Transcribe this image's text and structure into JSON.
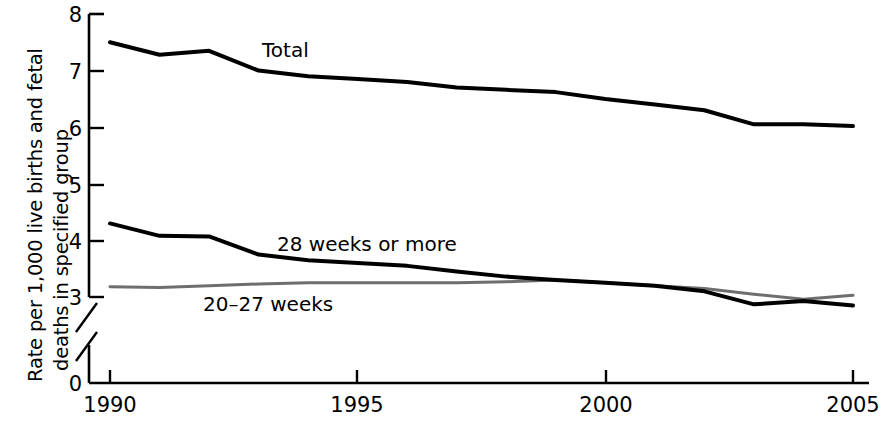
{
  "figure": {
    "background": "#ffffff",
    "axis_color": "#000000"
  },
  "axes": {
    "y_label_line_1": "Rate per 1,000 live births and fetal",
    "y_label_line_2": "deaths in specified group",
    "y_ticks": [
      "8",
      "7",
      "6",
      "5",
      "4",
      "3",
      "0"
    ],
    "y_axis_break": true,
    "x_ticks": [
      "1990",
      "1995",
      "2000",
      "2005"
    ]
  },
  "series_labels": {
    "total": "Total",
    "weeks28": "28 weeks or more",
    "weeks2027": "20–27 weeks"
  },
  "colors": {
    "total": "#000000",
    "weeks28": "#000000",
    "weeks2027": "#6e6e6e"
  },
  "chart_data": {
    "type": "line",
    "title": "",
    "xlabel": "",
    "ylabel": "Rate per 1,000 live births and fetal deaths in specified group",
    "xlim": [
      1990,
      2005
    ],
    "ylim": [
      3,
      8
    ],
    "y_axis_break_below": 3,
    "y_zero_shown": true,
    "grid": false,
    "legend": "inline-annotations",
    "x": [
      1990,
      1991,
      1992,
      1993,
      1994,
      1995,
      1996,
      1997,
      1998,
      1999,
      2000,
      2001,
      2002,
      2003,
      2004,
      2005
    ],
    "series": [
      {
        "name": "Total",
        "color": "#000000",
        "values": [
          7.5,
          7.28,
          7.35,
          7.0,
          6.9,
          6.85,
          6.8,
          6.7,
          6.66,
          6.62,
          6.5,
          6.4,
          6.3,
          6.05,
          6.05,
          6.02
        ]
      },
      {
        "name": "28 weeks or more",
        "color": "#000000",
        "values": [
          4.3,
          4.08,
          4.07,
          3.75,
          3.65,
          3.6,
          3.55,
          3.45,
          3.36,
          3.3,
          3.25,
          3.2,
          3.1,
          2.87,
          2.93,
          2.85
        ]
      },
      {
        "name": "20–27 weeks",
        "color": "#6e6e6e",
        "values": [
          3.18,
          3.17,
          3.2,
          3.23,
          3.25,
          3.25,
          3.25,
          3.25,
          3.27,
          3.3,
          3.25,
          3.2,
          3.15,
          3.05,
          2.96,
          3.03
        ]
      }
    ]
  }
}
